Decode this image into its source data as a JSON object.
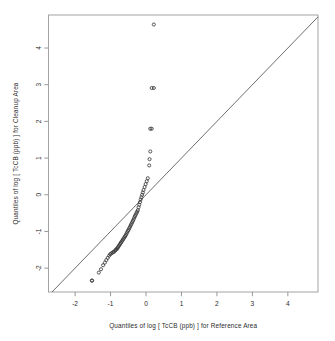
{
  "figure": {
    "kind": "qq-plot",
    "background_color": "#ffffff",
    "frame_color": "#9a9a9a",
    "point_color": "#3a3a3a",
    "reference_line_color": "#545454",
    "width": 335,
    "height": 341
  },
  "chart_data": {
    "type": "scatter",
    "title": "",
    "xlabel": "Quantiles of log [ TcCB (ppb) ] for Reference Area",
    "ylabel": "Quantiles of log [ TcCB (ppb) ] for Cleanup Area",
    "xlim": [
      -2.75,
      4.85
    ],
    "ylim": [
      -2.65,
      4.9
    ],
    "xticks": [
      -2,
      -1,
      0,
      1,
      2,
      3,
      4
    ],
    "xtick_labels": [
      "-2",
      "-1",
      "0",
      "1",
      "2",
      "3",
      "4"
    ],
    "yticks": [
      -2,
      -1,
      0,
      1,
      2,
      3,
      4
    ],
    "ytick_labels": [
      "-2",
      "-1",
      "0",
      "1",
      "2",
      "3",
      "4"
    ],
    "grid": false,
    "legend": null,
    "marker": "open-circle",
    "marker_size": 3.1,
    "annotations": [
      {
        "name": "reference-line",
        "type": "line",
        "slope": 1,
        "intercept": 0,
        "label": "1:1 line"
      }
    ],
    "series": [
      {
        "name": "Cleanup vs Reference quantiles",
        "x": [
          -1.53,
          -1.52,
          -1.33,
          -1.27,
          -1.21,
          -1.16,
          -1.12,
          -1.08,
          -1.04,
          -1.01,
          -0.98,
          -0.95,
          -0.92,
          -0.9,
          -0.87,
          -0.85,
          -0.83,
          -0.81,
          -0.79,
          -0.77,
          -0.75,
          -0.73,
          -0.71,
          -0.69,
          -0.67,
          -0.65,
          -0.63,
          -0.61,
          -0.59,
          -0.57,
          -0.55,
          -0.53,
          -0.51,
          -0.49,
          -0.47,
          -0.45,
          -0.43,
          -0.41,
          -0.39,
          -0.37,
          -0.35,
          -0.33,
          -0.31,
          -0.29,
          -0.27,
          -0.25,
          -0.23,
          -0.21,
          -0.19,
          -0.17,
          -0.15,
          -0.13,
          -0.11,
          -0.09,
          -0.07,
          -0.04,
          -0.01,
          0.02,
          0.05,
          0.09,
          0.1,
          0.12,
          0.16,
          0.22
        ],
        "y": [
          -2.34,
          -2.34,
          -2.12,
          -2.03,
          -1.92,
          -1.85,
          -1.78,
          -1.72,
          -1.66,
          -1.62,
          -1.6,
          -1.58,
          -1.56,
          -1.55,
          -1.52,
          -1.5,
          -1.48,
          -1.46,
          -1.43,
          -1.4,
          -1.37,
          -1.34,
          -1.31,
          -1.28,
          -1.25,
          -1.22,
          -1.19,
          -1.16,
          -1.13,
          -1.1,
          -1.06,
          -1.02,
          -0.98,
          -0.95,
          -0.91,
          -0.87,
          -0.83,
          -0.79,
          -0.75,
          -0.71,
          -0.67,
          -0.62,
          -0.58,
          -0.54,
          -0.5,
          -0.46,
          -0.42,
          -0.34,
          -0.27,
          -0.2,
          -0.13,
          -0.07,
          0.0,
          0.06,
          0.13,
          0.21,
          0.29,
          0.37,
          0.45,
          0.8,
          0.97,
          1.18,
          1.8,
          2.91
        ]
      }
    ],
    "extreme_points": [
      {
        "x": 0.22,
        "y": 4.64,
        "note": "upper outlier"
      },
      {
        "x": 0.16,
        "y": 2.91,
        "note": "outlier"
      },
      {
        "x": 0.12,
        "y": 1.8,
        "note": "outlier"
      }
    ]
  }
}
